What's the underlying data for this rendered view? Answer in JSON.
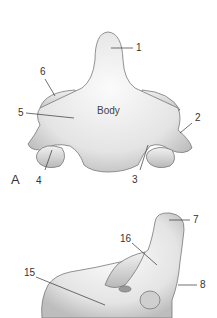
{
  "figure": {
    "panel_a": {
      "panel_label": "A",
      "center_label": "Body",
      "callouts": [
        "1",
        "2",
        "3",
        "4",
        "5",
        "6"
      ]
    },
    "panel_b": {
      "callouts": [
        "7",
        "8",
        "15",
        "16"
      ]
    }
  }
}
